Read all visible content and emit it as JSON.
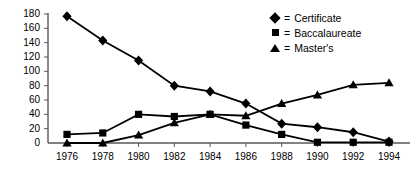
{
  "chart_data": {
    "type": "line",
    "title": "",
    "xlabel": "",
    "ylabel": "",
    "x": [
      1976,
      1978,
      1980,
      1982,
      1984,
      1986,
      1988,
      1990,
      1992,
      1994
    ],
    "xtick_labels": [
      "1976",
      "1978",
      "1980",
      "1982",
      "1984",
      "1986",
      "1988",
      "1990",
      "1992",
      "1994"
    ],
    "ytick_labels": [
      "0",
      "20",
      "40",
      "60",
      "80",
      "100",
      "120",
      "140",
      "160",
      "180"
    ],
    "yticks": [
      0,
      20,
      40,
      60,
      80,
      100,
      120,
      140,
      160,
      180
    ],
    "ylim": [
      0,
      180
    ],
    "xlim": [
      1976,
      1994
    ],
    "grid": false,
    "legend_position": "top-right",
    "series": [
      {
        "name": "Certificate",
        "marker": "diamond",
        "legend_label": "= Certificate",
        "values": [
          177,
          143,
          115,
          80,
          72,
          55,
          27,
          22,
          15,
          2
        ]
      },
      {
        "name": "Baccalaureate",
        "marker": "square",
        "legend_label": "= Baccalaureate",
        "values": [
          12,
          14,
          40,
          37,
          40,
          25,
          12,
          1,
          1,
          1
        ]
      },
      {
        "name": "Master's",
        "marker": "triangle",
        "legend_label": "= Master's",
        "values": [
          0,
          0,
          11,
          28,
          40,
          38,
          55,
          67,
          81,
          84
        ]
      }
    ],
    "colors": {
      "line": "#000000",
      "marker": "#000000",
      "axis": "#595959",
      "background": "#ffffff"
    }
  },
  "legend": {
    "equals_sign": "=",
    "items": [
      {
        "marker": "diamond",
        "label": "Certificate"
      },
      {
        "marker": "square",
        "label": "Baccalaureate"
      },
      {
        "marker": "triangle",
        "label": "Master's"
      }
    ]
  }
}
